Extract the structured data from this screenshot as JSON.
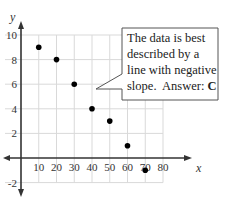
{
  "chart_data": {
    "type": "scatter",
    "title": "",
    "xlabel": "x",
    "ylabel": "y",
    "x": [
      10,
      20,
      30,
      40,
      50,
      60,
      70
    ],
    "y": [
      9,
      8,
      6,
      4,
      3,
      1,
      -1
    ],
    "xlim": [
      0,
      80
    ],
    "ylim": [
      -2,
      10
    ],
    "x_ticks": [
      10,
      20,
      30,
      40,
      50,
      60,
      70,
      80
    ],
    "y_ticks": [
      10,
      8,
      6,
      4,
      2,
      -2
    ],
    "grid": true,
    "annotations": [
      {
        "type": "callout",
        "text": "The data is best described by a line with negative slope.  Answer: C"
      }
    ]
  },
  "callout": {
    "lines": [
      "The data is best",
      "described by a",
      "line with negative",
      "slope.  Answer: "
    ],
    "answer": "C"
  },
  "colors": {
    "grid": "#d9d9d9",
    "axis": "#333333",
    "points": "#000000",
    "callout_border": "#555555"
  }
}
